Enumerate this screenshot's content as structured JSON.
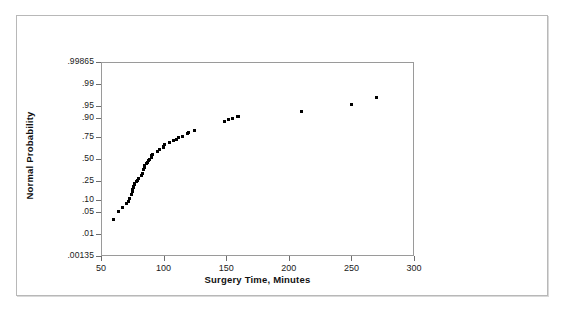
{
  "figure": {
    "background_color": "#ffffff",
    "frame_color": "#b8b8b8"
  },
  "chart_data": {
    "type": "scatter",
    "title": "",
    "subtitle": "",
    "xlabel": "Surgery Time, Minutes",
    "ylabel": "Normal Probability",
    "xlim": [
      50,
      300
    ],
    "ylim": [
      0.00135,
      0.99865
    ],
    "yscale": "normal-probability",
    "grid": false,
    "legend": null,
    "xticks": [
      50,
      100,
      150,
      200,
      250,
      300
    ],
    "xtick_labels": [
      "50",
      "100",
      "150",
      "200",
      "250",
      "300"
    ],
    "yticks": [
      0.00135,
      0.01,
      0.05,
      0.1,
      0.25,
      0.5,
      0.75,
      0.9,
      0.95,
      0.99,
      0.99865
    ],
    "ytick_labels": [
      ".00135",
      ".01",
      ".05",
      ".10",
      ".25",
      ".50",
      ".75",
      ".90",
      ".95",
      ".99",
      ".99865"
    ],
    "marker": {
      "shape": "square",
      "color": "#000000",
      "size_px": 3
    },
    "series": [
      {
        "name": "Surgery Time",
        "x": [
          60,
          64,
          67,
          70,
          72,
          73,
          74,
          75,
          75,
          76,
          76,
          77,
          77,
          78,
          79,
          80,
          82,
          83,
          84,
          85,
          85,
          86,
          87,
          88,
          89,
          90,
          90,
          91,
          95,
          97,
          100,
          100,
          101,
          105,
          108,
          110,
          112,
          115,
          119,
          120,
          125,
          149,
          152,
          155,
          159,
          160,
          210,
          250,
          270
        ],
        "y": [
          0.03,
          0.052,
          0.065,
          0.085,
          0.095,
          0.11,
          0.135,
          0.155,
          0.17,
          0.185,
          0.2,
          0.215,
          0.228,
          0.24,
          0.252,
          0.278,
          0.3,
          0.33,
          0.375,
          0.4,
          0.42,
          0.442,
          0.462,
          0.48,
          0.5,
          0.52,
          0.54,
          0.56,
          0.59,
          0.62,
          0.64,
          0.655,
          0.67,
          0.695,
          0.715,
          0.73,
          0.742,
          0.76,
          0.785,
          0.795,
          0.815,
          0.875,
          0.888,
          0.896,
          0.905,
          0.908,
          0.93,
          0.955,
          0.972
        ]
      }
    ],
    "annotations": []
  }
}
